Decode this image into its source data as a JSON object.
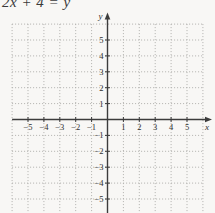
{
  "equation": {
    "text": "2x + 4 = y"
  },
  "chart_data": {
    "type": "line",
    "title": "2x + 4 = y",
    "equation": "2x + 4 = y",
    "xlabel": "x",
    "ylabel": "y",
    "xlim": [
      -6,
      6
    ],
    "ylim": [
      -6,
      6
    ],
    "grid": true,
    "axis_arrows": [
      "+x",
      "+y"
    ],
    "x_ticks": [
      -5,
      -4,
      -3,
      -2,
      -1,
      1,
      2,
      3,
      4,
      5
    ],
    "y_ticks": [
      5,
      4,
      3,
      2,
      1,
      -1,
      -2,
      -3,
      -4,
      -5
    ],
    "series": []
  },
  "colors": {
    "background": "#f8f7f5",
    "grid_line": "#b1b0ae",
    "axis": "#3c3c3c",
    "label": "#2f2f2f"
  }
}
